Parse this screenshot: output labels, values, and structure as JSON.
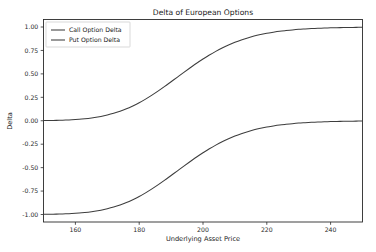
{
  "chart_data": {
    "type": "line",
    "title": "Delta of European Options",
    "xlabel": "Underlying Asset Price",
    "ylabel": "Delta",
    "xlim": [
      150,
      250
    ],
    "ylim": [
      -1.08,
      1.08
    ],
    "grid": false,
    "legend_position": "upper left",
    "xticks": [
      160,
      180,
      200,
      220,
      240
    ],
    "xtick_labels": [
      "160",
      "180",
      "200",
      "220",
      "240"
    ],
    "yticks": [
      1.0,
      0.75,
      0.5,
      0.25,
      0.0,
      -0.25,
      -0.5,
      -0.75,
      -1.0
    ],
    "ytick_labels": [
      "1.00",
      "0.75",
      "0.50",
      "0.25",
      "0.00",
      "-0.25",
      "-0.50",
      "-0.75",
      "-1.00"
    ],
    "x": [
      150,
      152,
      154,
      156,
      158,
      160,
      162,
      164,
      166,
      168,
      170,
      172,
      174,
      176,
      178,
      180,
      182,
      184,
      186,
      188,
      190,
      192,
      194,
      196,
      198,
      200,
      202,
      204,
      206,
      208,
      210,
      212,
      214,
      216,
      218,
      220,
      222,
      224,
      226,
      228,
      230,
      232,
      234,
      236,
      238,
      240,
      242,
      244,
      246,
      248,
      250
    ],
    "series": [
      {
        "name": "Call Option Delta",
        "color": "#3d3d3d",
        "values": [
          0.002,
          0.003,
          0.004,
          0.006,
          0.009,
          0.013,
          0.018,
          0.025,
          0.034,
          0.046,
          0.061,
          0.079,
          0.101,
          0.127,
          0.158,
          0.192,
          0.231,
          0.273,
          0.318,
          0.366,
          0.416,
          0.466,
          0.516,
          0.565,
          0.613,
          0.658,
          0.701,
          0.74,
          0.776,
          0.808,
          0.837,
          0.862,
          0.884,
          0.903,
          0.919,
          0.933,
          0.944,
          0.954,
          0.962,
          0.969,
          0.975,
          0.979,
          0.983,
          0.986,
          0.989,
          0.991,
          0.993,
          0.994,
          0.995,
          0.996,
          0.997
        ]
      },
      {
        "name": "Put Option Delta",
        "color": "#3d3d3d",
        "values": [
          -0.998,
          -0.997,
          -0.996,
          -0.994,
          -0.991,
          -0.987,
          -0.982,
          -0.975,
          -0.966,
          -0.954,
          -0.939,
          -0.921,
          -0.899,
          -0.873,
          -0.842,
          -0.808,
          -0.769,
          -0.727,
          -0.682,
          -0.634,
          -0.584,
          -0.534,
          -0.484,
          -0.435,
          -0.387,
          -0.342,
          -0.299,
          -0.26,
          -0.224,
          -0.192,
          -0.163,
          -0.138,
          -0.116,
          -0.097,
          -0.081,
          -0.067,
          -0.056,
          -0.046,
          -0.038,
          -0.031,
          -0.025,
          -0.021,
          -0.017,
          -0.014,
          -0.011,
          -0.009,
          -0.007,
          -0.006,
          -0.005,
          -0.004,
          -0.003
        ]
      }
    ]
  },
  "legend": {
    "entries": [
      {
        "label": "Call Option Delta"
      },
      {
        "label": "Put Option Delta"
      }
    ]
  }
}
